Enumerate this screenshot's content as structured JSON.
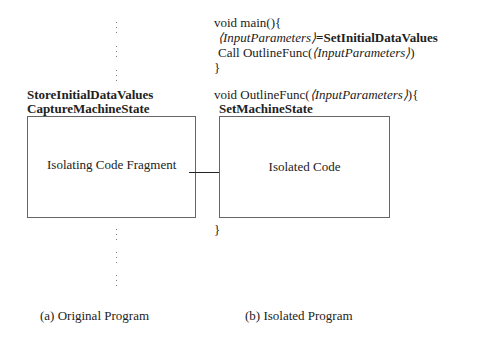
{
  "left_panel": {
    "header_line1": "StoreInitialDataValues",
    "header_line2": "CaptureMachineState",
    "box_label": "Isolating Code Fragment",
    "caption": "(a) Original Program",
    "ellipsis_glyph": "⋮"
  },
  "right_panel": {
    "main_signature": "void main(){",
    "assign_lhs": "⟨InputParameters⟩",
    "assign_op": "=",
    "assign_rhs": "SetInitialDataValues",
    "call_prefix": "Call OutlineFunc(",
    "call_arg": "⟨InputParameters⟩",
    "call_suffix": ")",
    "main_close": "}",
    "outline_prefix": "void OutlineFunc(",
    "outline_arg": "⟨InputParameters⟩",
    "outline_suffix": "){",
    "set_state": "SetMachineState",
    "box_label": "Isolated Code",
    "outline_close": "}",
    "caption": "(b) Isolated Program"
  },
  "arrow": {
    "direction": "right",
    "from": "Isolating Code Fragment",
    "to": "Isolated Code"
  },
  "colors": {
    "text": "#222222",
    "box_border": "#666666",
    "background": "#ffffff"
  }
}
